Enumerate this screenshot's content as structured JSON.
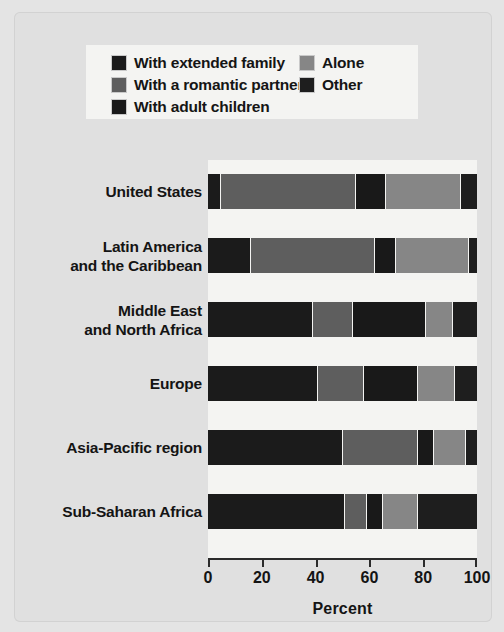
{
  "chart_data": {
    "type": "bar",
    "orientation": "horizontal",
    "stacked": true,
    "stacked_percent": true,
    "title": "",
    "xlabel": "Percent",
    "ylabel": "",
    "xlim": [
      0,
      100
    ],
    "xticks": [
      0,
      20,
      40,
      60,
      80,
      100
    ],
    "grid": false,
    "legend_position": "top",
    "categories": [
      "United States",
      "Latin America and the Caribbean",
      "Middle East and North Africa",
      "Europe",
      "Asia-Pacific region",
      "Sub-Saharan Africa"
    ],
    "series": [
      {
        "name": "With extended family",
        "color": "#1b1b1b",
        "values": [
          5,
          16,
          39,
          41,
          50,
          51
        ]
      },
      {
        "name": "With a romantic partner",
        "color": "#5e5e5e",
        "values": [
          50,
          46,
          15,
          17,
          28,
          8
        ]
      },
      {
        "name": "With adult children",
        "color": "#191919",
        "values": [
          11,
          8,
          27,
          20,
          6,
          6
        ]
      },
      {
        "name": "Alone",
        "color": "#868686",
        "values": [
          28,
          27,
          10,
          14,
          12,
          13
        ]
      },
      {
        "name": "Other",
        "color": "#1e1e1e",
        "values": [
          6,
          3,
          9,
          8,
          4,
          22
        ]
      }
    ]
  },
  "legend": {
    "columns": [
      {
        "entries": [
          {
            "label": "With extended family",
            "swatch_name": "legend-swatch-extended-family"
          },
          {
            "label": "With a romantic partner",
            "swatch_name": "legend-swatch-romantic-partner"
          },
          {
            "label": "With adult children",
            "swatch_name": "legend-swatch-adult-children"
          }
        ]
      },
      {
        "entries": [
          {
            "label": "Alone",
            "swatch_name": "legend-swatch-alone"
          },
          {
            "label": "Other",
            "swatch_name": "legend-swatch-other"
          }
        ]
      }
    ]
  },
  "axis": {
    "tick_labels": [
      "0",
      "20",
      "40",
      "60",
      "80",
      "100"
    ],
    "title": "Percent"
  },
  "ylabels": [
    {
      "lines": [
        "United States"
      ]
    },
    {
      "lines": [
        "Latin America",
        "and the Caribbean"
      ]
    },
    {
      "lines": [
        "Middle East",
        "and North Africa"
      ]
    },
    {
      "lines": [
        "Europe"
      ]
    },
    {
      "lines": [
        "Asia-Pacific region"
      ]
    },
    {
      "lines": [
        "Sub-Saharan Africa"
      ]
    }
  ],
  "colors": {
    "page_background": "#e4e4e4",
    "panel_background": "#e0e0e0",
    "plot_background": "#f4f4f2",
    "axis": "#2b2b2b",
    "text": "#141414"
  }
}
